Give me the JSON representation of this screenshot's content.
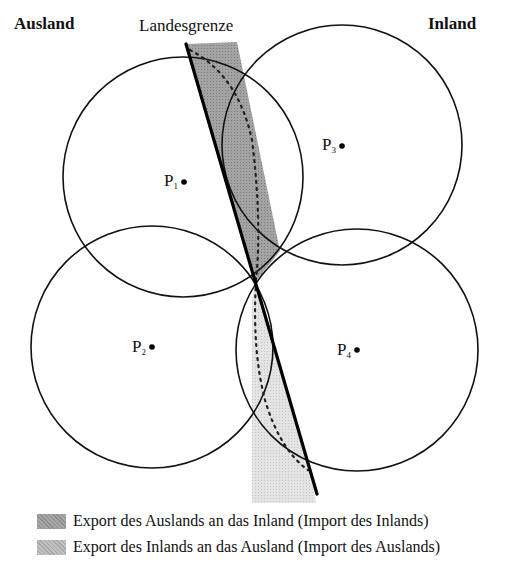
{
  "labels": {
    "foreign": "Ausland",
    "domestic": "Inland",
    "border": "Landesgrenze"
  },
  "points": [
    {
      "name": "P",
      "sub": "1",
      "cx": 183,
      "cy": 181
    },
    {
      "name": "P",
      "sub": "2",
      "cx": 152,
      "cy": 347
    },
    {
      "name": "P",
      "sub": "3",
      "cx": 342,
      "cy": 145
    },
    {
      "name": "P",
      "sub": "4",
      "cx": 356,
      "cy": 350
    }
  ],
  "circles": [
    {
      "id": "c1",
      "cx": 183,
      "cy": 177,
      "r": 120
    },
    {
      "id": "c2",
      "cx": 152,
      "cy": 347,
      "r": 120
    },
    {
      "id": "c3",
      "cx": 342,
      "cy": 145,
      "r": 120
    },
    {
      "id": "c4",
      "cx": 357,
      "cy": 350,
      "r": 121
    }
  ],
  "legend": [
    {
      "label": "Export des Auslands an das Inland (Import des Inlands)",
      "color": "#999999"
    },
    {
      "label": "Export des Inlands an das Ausland (Import des Auslands)",
      "color": "#bcbcbc"
    }
  ],
  "colors": {
    "dark_region": "#9a9a9a",
    "light_region": "#dedede",
    "stroke": "#111111"
  }
}
